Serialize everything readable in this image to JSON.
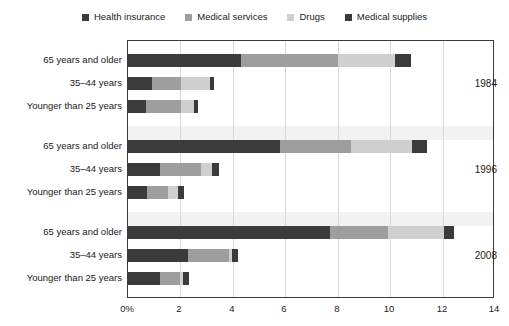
{
  "legend": {
    "items": [
      {
        "label": "Health insurance",
        "color": "#3b3b3b",
        "key": "health_insurance"
      },
      {
        "label": "Medical services",
        "color": "#9e9e9e",
        "key": "medical_services"
      },
      {
        "label": "Drugs",
        "color": "#cfcfcf",
        "key": "drugs"
      },
      {
        "label": "Medical supplies",
        "color": "#3b3b3b",
        "key": "medical_supplies"
      }
    ]
  },
  "axis": {
    "x_ticks": [
      "0%",
      "2",
      "4",
      "6",
      "8",
      "10",
      "12",
      "14"
    ],
    "x_values": [
      0,
      2,
      4,
      6,
      8,
      10,
      12,
      14
    ],
    "x_min": 0,
    "x_max": 14
  },
  "groups": [
    {
      "year": "1984",
      "rows": [
        {
          "category": "65 years and older",
          "values": [
            4.3,
            3.7,
            2.2,
            0.6
          ]
        },
        {
          "category": "35–44 years",
          "values": [
            0.92,
            1.1,
            1.12,
            0.16
          ]
        },
        {
          "category": "Younger than 25 years",
          "values": [
            0.7,
            1.34,
            0.46,
            0.16
          ]
        }
      ]
    },
    {
      "year": "1996",
      "rows": [
        {
          "category": "65 years and older",
          "values": [
            5.8,
            2.7,
            2.35,
            0.55
          ]
        },
        {
          "category": "35–44 years",
          "values": [
            1.22,
            1.55,
            0.42,
            0.28
          ]
        },
        {
          "category": "Younger than 25 years",
          "values": [
            0.72,
            0.8,
            0.38,
            0.22
          ]
        }
      ]
    },
    {
      "year": "2008",
      "rows": [
        {
          "category": "65 years and older",
          "values": [
            7.7,
            2.2,
            2.15,
            0.38
          ]
        },
        {
          "category": "35–44 years",
          "values": [
            2.3,
            1.55,
            0.12,
            0.24
          ]
        },
        {
          "category": "Younger than 25 years",
          "values": [
            1.22,
            0.78,
            0.1,
            0.22
          ]
        }
      ]
    }
  ],
  "chart_data": {
    "type": "bar",
    "orientation": "horizontal",
    "stacked": true,
    "title": "",
    "xlabel": "",
    "ylabel": "",
    "xlim": [
      0,
      14
    ],
    "xticks": [
      0,
      2,
      4,
      6,
      8,
      10,
      12,
      14
    ],
    "xticklabels": [
      "0%",
      "2",
      "4",
      "6",
      "8",
      "10",
      "12",
      "14"
    ],
    "grid": true,
    "legend_position": "top-center",
    "series": [
      {
        "name": "Health insurance",
        "color": "#3b3b3b",
        "values": [
          4.3,
          0.92,
          0.7,
          5.8,
          1.22,
          0.72,
          7.7,
          2.3,
          1.22
        ]
      },
      {
        "name": "Medical services",
        "color": "#9e9e9e",
        "values": [
          3.7,
          1.1,
          1.34,
          2.7,
          1.55,
          0.8,
          2.2,
          1.55,
          0.78
        ]
      },
      {
        "name": "Drugs",
        "color": "#cfcfcf",
        "values": [
          2.2,
          1.12,
          0.46,
          2.35,
          0.42,
          0.38,
          2.15,
          0.12,
          0.1
        ]
      },
      {
        "name": "Medical supplies",
        "color": "#3b3b3b",
        "values": [
          0.6,
          0.16,
          0.16,
          0.55,
          0.28,
          0.22,
          0.38,
          0.24,
          0.22
        ]
      }
    ],
    "categories": [
      "1984 – 65 years and older",
      "1984 – 35–44 years",
      "1984 – Younger than 25 years",
      "1996 – 65 years and older",
      "1996 – 35–44 years",
      "1996 – Younger than 25 years",
      "2008 – 65 years and older",
      "2008 – 35–44 years",
      "2008 – Younger than 25 years"
    ],
    "totals": [
      10.8,
      3.3,
      2.66,
      11.4,
      3.47,
      2.12,
      12.43,
      4.21,
      2.32
    ],
    "group_labels": [
      "1984",
      "1996",
      "2008"
    ]
  }
}
